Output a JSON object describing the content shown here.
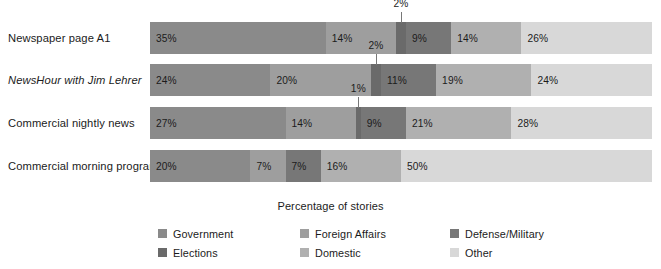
{
  "chart_data": {
    "type": "bar",
    "subtype": "stacked-horizontal-100",
    "title": "",
    "xlabel": "Percentage of stories",
    "ylabel": "",
    "xlim": [
      0,
      100
    ],
    "grid": false,
    "legend_position": "bottom",
    "value_suffix": "%",
    "categories": [
      "Newspaper page A1",
      "NewsHour with Jim Lehrer",
      "Commercial nightly news",
      "Commercial morning program"
    ],
    "series": [
      {
        "name": "Government",
        "color": "#8a8a8a",
        "values": [
          35,
          24,
          27,
          20
        ]
      },
      {
        "name": "Foreign Affairs",
        "color": "#9e9e9e",
        "values": [
          14,
          20,
          14,
          7
        ]
      },
      {
        "name": "Elections",
        "color": "#6a6a6a",
        "values": [
          2,
          2,
          1,
          0
        ]
      },
      {
        "name": "Defense/Military",
        "color": "#777777",
        "values": [
          9,
          11,
          9,
          7
        ]
      },
      {
        "name": "Domestic",
        "color": "#b0b0b0",
        "values": [
          14,
          19,
          21,
          16
        ]
      },
      {
        "name": "Other",
        "color": "#d8d8d8",
        "values": [
          26,
          24,
          28,
          50
        ]
      }
    ]
  },
  "rows": [
    {
      "label": "Newspaper page A1",
      "italic": false,
      "segments": [
        {
          "series": "Government",
          "value": 35,
          "label": "35%",
          "color": "#8a8a8a",
          "callout": false
        },
        {
          "series": "Foreign Affairs",
          "value": 14,
          "label": "14%",
          "color": "#9e9e9e",
          "callout": false
        },
        {
          "series": "Elections",
          "value": 2,
          "label": "2%",
          "color": "#6a6a6a",
          "callout": true
        },
        {
          "series": "Defense/Military",
          "value": 9,
          "label": "9%",
          "color": "#777777",
          "callout": false
        },
        {
          "series": "Domestic",
          "value": 14,
          "label": "14%",
          "color": "#b0b0b0",
          "callout": false
        },
        {
          "series": "Other",
          "value": 26,
          "label": "26%",
          "color": "#d8d8d8",
          "callout": false
        }
      ]
    },
    {
      "label": "NewsHour with Jim Lehrer",
      "italic": true,
      "segments": [
        {
          "series": "Government",
          "value": 24,
          "label": "24%",
          "color": "#8a8a8a",
          "callout": false
        },
        {
          "series": "Foreign Affairs",
          "value": 20,
          "label": "20%",
          "color": "#9e9e9e",
          "callout": false
        },
        {
          "series": "Elections",
          "value": 2,
          "label": "2%",
          "color": "#6a6a6a",
          "callout": true
        },
        {
          "series": "Defense/Military",
          "value": 11,
          "label": "11%",
          "color": "#777777",
          "callout": false
        },
        {
          "series": "Domestic",
          "value": 19,
          "label": "19%",
          "color": "#b0b0b0",
          "callout": false
        },
        {
          "series": "Other",
          "value": 24,
          "label": "24%",
          "color": "#d8d8d8",
          "callout": false
        }
      ]
    },
    {
      "label": "Commercial nightly news",
      "italic": false,
      "segments": [
        {
          "series": "Government",
          "value": 27,
          "label": "27%",
          "color": "#8a8a8a",
          "callout": false
        },
        {
          "series": "Foreign Affairs",
          "value": 14,
          "label": "14%",
          "color": "#9e9e9e",
          "callout": false
        },
        {
          "series": "Elections",
          "value": 1,
          "label": "1%",
          "color": "#6a6a6a",
          "callout": true
        },
        {
          "series": "Defense/Military",
          "value": 9,
          "label": "9%",
          "color": "#777777",
          "callout": false
        },
        {
          "series": "Domestic",
          "value": 21,
          "label": "21%",
          "color": "#b0b0b0",
          "callout": false
        },
        {
          "series": "Other",
          "value": 28,
          "label": "28%",
          "color": "#d8d8d8",
          "callout": false
        }
      ]
    },
    {
      "label": "Commercial morning program",
      "italic": false,
      "segments": [
        {
          "series": "Government",
          "value": 20,
          "label": "20%",
          "color": "#8a8a8a",
          "callout": false
        },
        {
          "series": "Foreign Affairs",
          "value": 7,
          "label": "7%",
          "color": "#9e9e9e",
          "callout": false
        },
        {
          "series": "Defense/Military",
          "value": 7,
          "label": "7%",
          "color": "#777777",
          "callout": false
        },
        {
          "series": "Domestic",
          "value": 16,
          "label": "16%",
          "color": "#b0b0b0",
          "callout": false
        },
        {
          "series": "Other",
          "value": 50,
          "label": "50%",
          "color": "#d8d8d8",
          "callout": false
        }
      ]
    }
  ],
  "axis": {
    "title": "Percentage of stories"
  },
  "legend": {
    "items": [
      {
        "label": "Government",
        "color": "#8a8a8a"
      },
      {
        "label": "Elections",
        "color": "#6a6a6a"
      },
      {
        "label": "Foreign Affairs",
        "color": "#9e9e9e"
      },
      {
        "label": "Domestic",
        "color": "#b0b0b0"
      },
      {
        "label": "Defense/Military",
        "color": "#777777"
      },
      {
        "label": "Other",
        "color": "#d8d8d8"
      }
    ]
  }
}
